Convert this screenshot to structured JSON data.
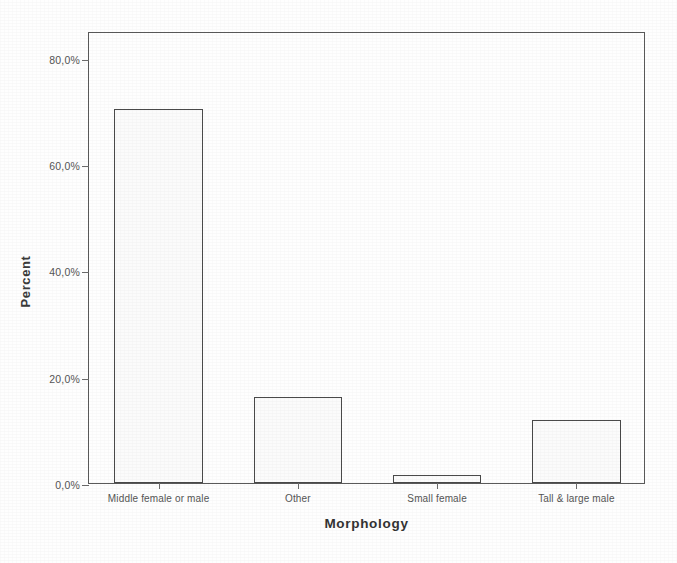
{
  "chart_data": {
    "type": "bar",
    "title": "",
    "xlabel": "Morphology",
    "ylabel": "Percent",
    "categories": [
      "Middle female or male",
      "Other",
      "Small female",
      "Tall & large male"
    ],
    "values": [
      70.3,
      16.2,
      1.6,
      11.9
    ],
    "value_labels": [
      "70,3%",
      "16,2%",
      "1,6%",
      "11,9%"
    ],
    "ylim": [
      0,
      85
    ],
    "ytick_values": [
      0,
      20,
      40,
      60,
      80
    ],
    "ytick_labels": [
      "0,0%",
      "20,0%",
      "40,0%",
      "60,0%",
      "80,0%"
    ],
    "grid": false,
    "legend": "none",
    "bar_fill": "#fbfbfb",
    "bar_outline": "#4a4a4a",
    "axis_color": "#5a5a5a",
    "background": "#fefefe",
    "decimal_separator": ","
  }
}
